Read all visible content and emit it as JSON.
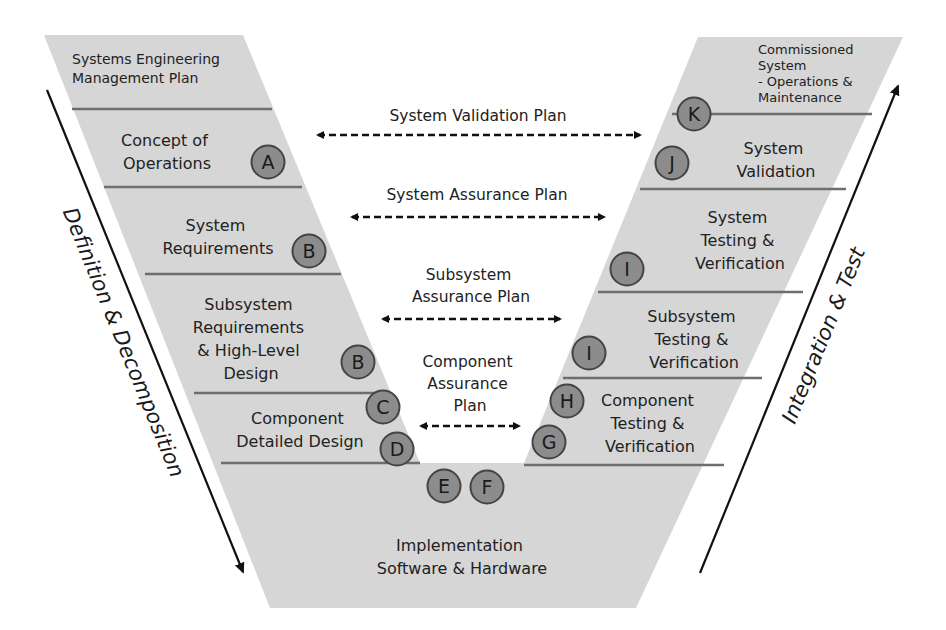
{
  "colors": {
    "shape_fill": "#d6d6d6",
    "divider": "#6e6e6e",
    "circle_fill": "#8c8c8c",
    "circle_border": "#444444",
    "text": "#222222",
    "arrow": "#111111"
  },
  "left_arm": {
    "stages": [
      {
        "label": [
          "Systems Engineering",
          "Management Plan"
        ]
      },
      {
        "label": [
          "Concept of",
          "Operations"
        ],
        "marker": "A"
      },
      {
        "label": [
          "System",
          "Requirements"
        ],
        "marker": "B"
      },
      {
        "label": [
          "Subsystem",
          "Requirements",
          "& High-Level",
          "Design"
        ],
        "marker": "B"
      },
      {
        "label": [
          "Component",
          "Detailed Design"
        ],
        "markers": [
          "C",
          "D"
        ]
      }
    ],
    "axis_label": "Definition & Decomposition"
  },
  "bottom": {
    "label": [
      "Implementation",
      "Software & Hardware"
    ],
    "markers": [
      "E",
      "F"
    ]
  },
  "right_arm": {
    "stages": [
      {
        "label": [
          "Commissioned",
          "System",
          "- Operations &",
          "Maintenance"
        ],
        "marker": "K"
      },
      {
        "label": [
          "System",
          "Validation"
        ],
        "marker": "J"
      },
      {
        "label": [
          "System",
          "Testing &",
          "Verification"
        ],
        "marker": "I"
      },
      {
        "label": [
          "Subsystem",
          "Testing &",
          "Verification"
        ],
        "marker": "I"
      },
      {
        "label": [
          "Component",
          "Testing &",
          "Verification"
        ],
        "markers": [
          "H",
          "G"
        ]
      }
    ],
    "axis_label": "Integration & Test"
  },
  "plans": [
    {
      "label": [
        "System Validation Plan"
      ]
    },
    {
      "label": [
        "System Assurance Plan"
      ]
    },
    {
      "label": [
        "Subsystem",
        "Assurance Plan"
      ]
    },
    {
      "label": [
        "Component",
        "Assurance",
        "Plan"
      ]
    }
  ]
}
